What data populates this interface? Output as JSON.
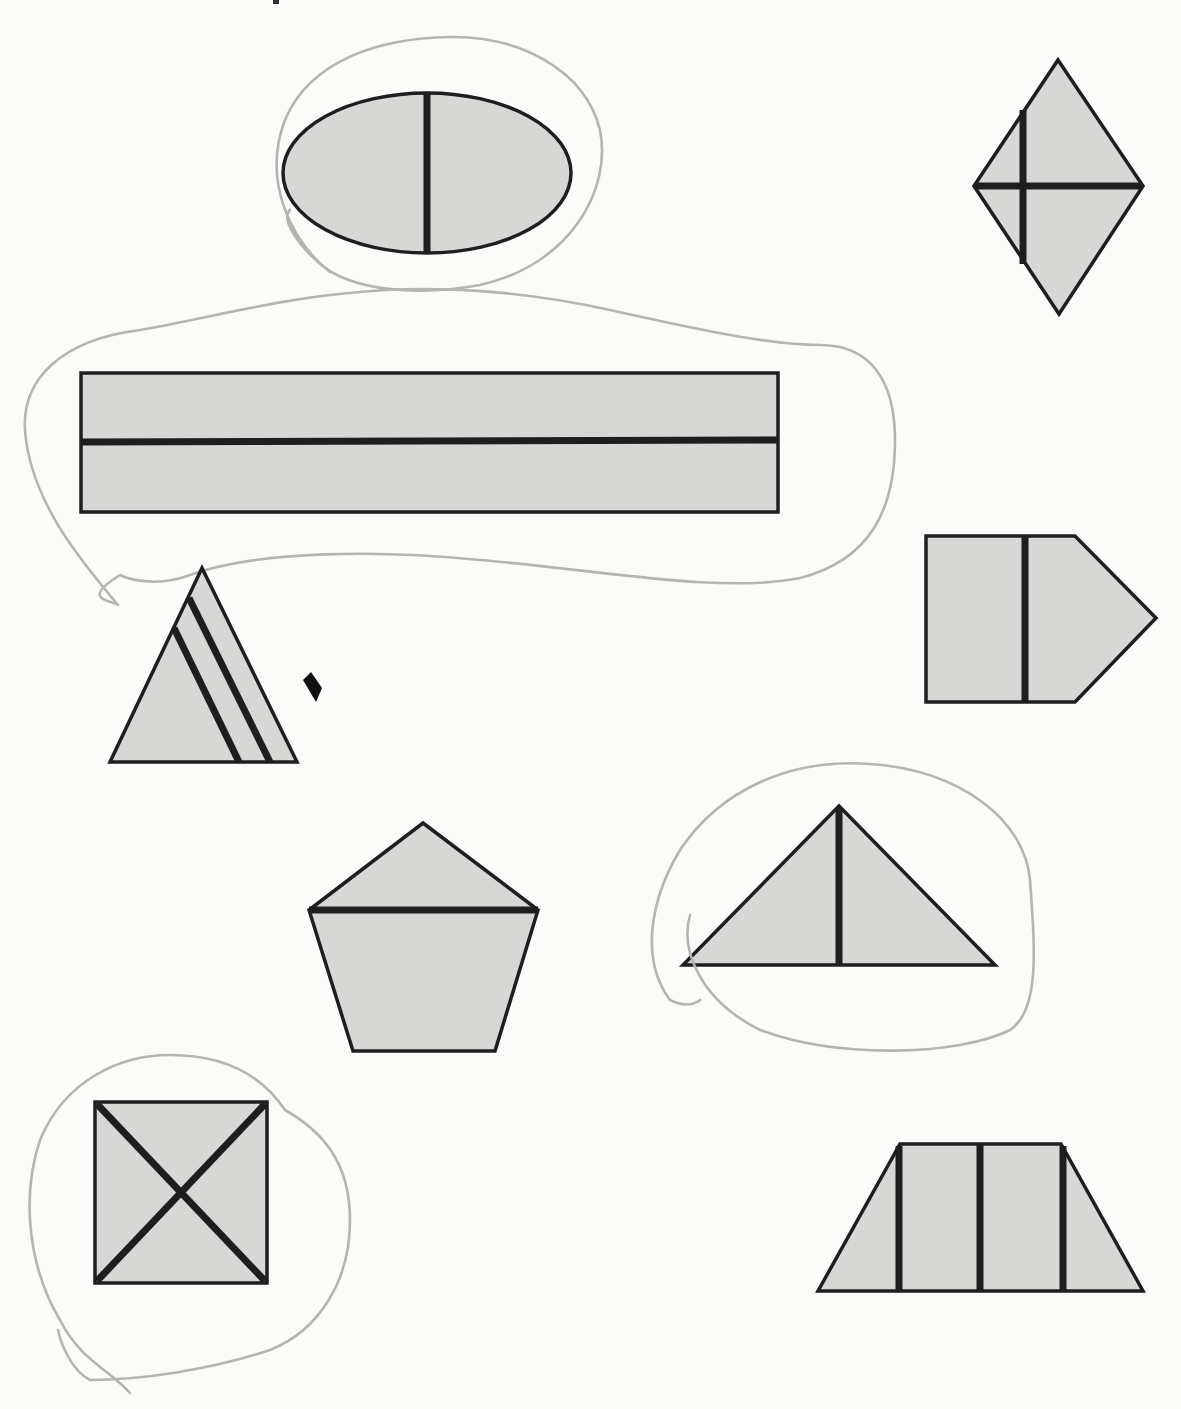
{
  "worksheet": {
    "description": "Shapes partitioned by dark lines; some circled in pencil",
    "colors": {
      "paper": "#fbfbf9",
      "shape_fill": "#d7d7d5",
      "outline": "#1e1e1e",
      "pencil": "#b4b4b2"
    },
    "shapes": [
      {
        "id": "oval",
        "kind": "ellipse",
        "partition": "1 vertical line",
        "parts": 2,
        "circled": true
      },
      {
        "id": "rhombus",
        "kind": "rhombus",
        "partition": "1 horizontal + 1 off-center vertical line",
        "parts": 4,
        "circled": false
      },
      {
        "id": "long-rectangle",
        "kind": "rectangle",
        "partition": "1 horizontal line",
        "parts": 2,
        "circled": true
      },
      {
        "id": "striped-triangle",
        "kind": "triangle",
        "partition": "2 parallel diagonal lines",
        "parts": 3,
        "circled": false
      },
      {
        "id": "pentagon-arrow",
        "kind": "pentagon (house-on-side)",
        "partition": "1 vertical line",
        "parts": 2,
        "circled": false
      },
      {
        "id": "pentagon",
        "kind": "pentagon",
        "partition": "1 horizontal line",
        "parts": 2,
        "circled": false
      },
      {
        "id": "wide-triangle",
        "kind": "triangle",
        "partition": "1 vertical line from apex",
        "parts": 2,
        "circled": true
      },
      {
        "id": "square-x",
        "kind": "square",
        "partition": "2 diagonals",
        "parts": 4,
        "circled": true
      },
      {
        "id": "trapezoid",
        "kind": "trapezoid",
        "partition": "3 vertical lines",
        "parts": 4,
        "circled": false
      }
    ]
  }
}
